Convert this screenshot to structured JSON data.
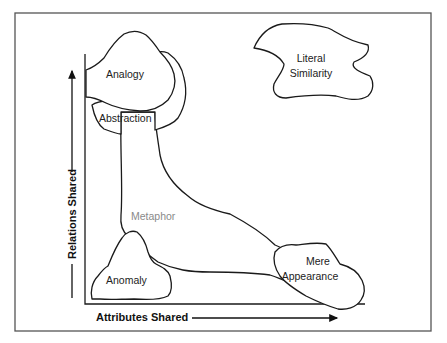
{
  "diagram": {
    "type": "similarity-space",
    "axes": {
      "x_label": "Attributes Shared",
      "y_label": "Relations Shared"
    },
    "regions": [
      {
        "id": "analogy",
        "label": "Analogy"
      },
      {
        "id": "abstraction",
        "label": "Abstraction"
      },
      {
        "id": "literal-similarity",
        "label_line1": "Literal",
        "label_line2": "Similarity"
      },
      {
        "id": "metaphor",
        "label": "Metaphor"
      },
      {
        "id": "anomaly",
        "label": "Anomaly"
      },
      {
        "id": "mere-appearance",
        "label_line1": "Mere",
        "label_line2": "Appearance"
      }
    ],
    "colors": {
      "stroke": "#1a1a1a",
      "metaphor_text": "#8a8a8a",
      "frame": "#555555"
    }
  }
}
